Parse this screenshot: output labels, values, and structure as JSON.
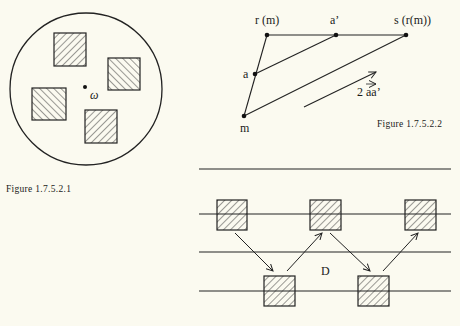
{
  "figure1": {
    "caption": "Figure 1.7.5.2.1",
    "center_label": "ω",
    "circle": {
      "cx": 86,
      "cy": 89,
      "r": 76
    },
    "center_point": {
      "x": 85,
      "y": 87
    },
    "squares": [
      {
        "name": "top",
        "x": 54,
        "y": 33,
        "w": 32,
        "h": 33,
        "hatch": "forward"
      },
      {
        "name": "right",
        "x": 108,
        "y": 58,
        "w": 32,
        "h": 32,
        "hatch": "backward"
      },
      {
        "name": "left",
        "x": 32,
        "y": 88,
        "w": 34,
        "h": 32,
        "hatch": "backward"
      },
      {
        "name": "bottom",
        "x": 85,
        "y": 110,
        "w": 32,
        "h": 33,
        "hatch": "forward"
      }
    ]
  },
  "figure2": {
    "caption": "Figure 1.7.5.2.2",
    "points": {
      "r_m": {
        "label": "r (m)",
        "x": 267,
        "y": 35
      },
      "a_prime": {
        "label": "a’",
        "x": 336,
        "y": 35
      },
      "s_r_m": {
        "label": "s (r(m))",
        "x": 406,
        "y": 35
      },
      "a": {
        "label": "a",
        "x": 255,
        "y": 74
      },
      "m": {
        "label": "m",
        "x": 244,
        "y": 116
      }
    },
    "vector_label": "2 aa’",
    "vector_arrow": {
      "x1": 304,
      "y1": 107,
      "x2": 376,
      "y2": 72
    }
  },
  "figure3": {
    "region_label": "D",
    "lines_y": [
      169,
      214,
      252,
      291
    ],
    "upper_squares": [
      {
        "x": 217,
        "y": 200
      },
      {
        "x": 310,
        "y": 200
      },
      {
        "x": 405,
        "y": 200
      }
    ],
    "lower_squares": [
      {
        "x": 264,
        "y": 276
      },
      {
        "x": 358,
        "y": 276
      }
    ],
    "arrows": [
      {
        "x1": 235,
        "y1": 233,
        "x2": 273,
        "y2": 271
      },
      {
        "x1": 287,
        "y1": 271,
        "x2": 322,
        "y2": 233
      },
      {
        "x1": 330,
        "y1": 233,
        "x2": 370,
        "y2": 271
      },
      {
        "x1": 383,
        "y1": 271,
        "x2": 418,
        "y2": 233
      }
    ]
  }
}
